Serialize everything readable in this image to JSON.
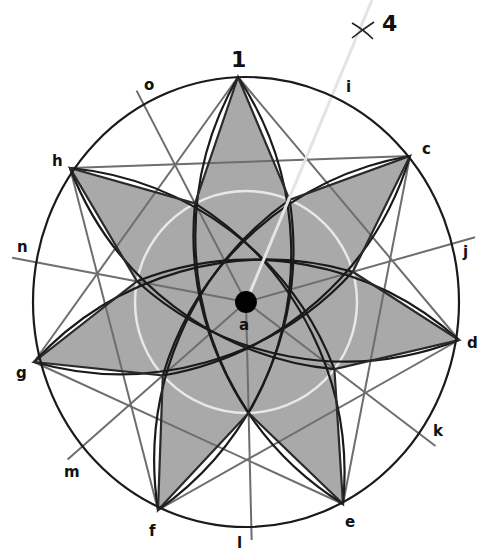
{
  "diagram": {
    "center_label": "a",
    "top_label": "1",
    "construction_mark_label": "4",
    "outer_point_labels": [
      "1",
      "c",
      "d",
      "e",
      "f",
      "g",
      "h"
    ],
    "radial_labels": [
      "i",
      "j",
      "k",
      "l",
      "m",
      "n",
      "o"
    ],
    "point_count": 7,
    "colors": {
      "star_fill": "#a9a9a9",
      "outline": "#1a1a1a",
      "construction_line": "#6e6e6e",
      "guide_line": "#e4e4e4",
      "inner_ring": "#e8e8e8",
      "center_dot": "#000000"
    }
  }
}
